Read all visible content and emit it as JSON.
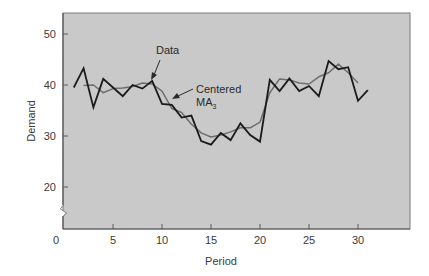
{
  "chart_data": {
    "type": "line",
    "title": "",
    "xlabel": "Period",
    "ylabel": "Demand",
    "xlim": [
      0,
      35.3
    ],
    "ylim": [
      12,
      53.5
    ],
    "axis_break_y": true,
    "grid": false,
    "legend_position": "none (inline annotations)",
    "x_ticks": [
      0,
      5,
      10,
      15,
      20,
      25,
      30
    ],
    "x_tick_labels": [
      "0",
      "5",
      "10",
      "15",
      "20",
      "25",
      "30"
    ],
    "y_ticks": [
      20,
      30,
      40,
      50
    ],
    "y_tick_labels": [
      "20",
      "30",
      "40",
      "50"
    ],
    "background_color": "#c9c9c9",
    "series": [
      {
        "name": "Data",
        "color": "#1a1a1a",
        "x": [
          1,
          2,
          3,
          4,
          5,
          6,
          7,
          8,
          9,
          10,
          11,
          12,
          13,
          14,
          15,
          16,
          17,
          18,
          19,
          20,
          21,
          22,
          23,
          24,
          25,
          26,
          27,
          28,
          29,
          30,
          31
        ],
        "values": [
          39.5,
          43.3,
          35.6,
          41.2,
          39.5,
          37.8,
          40.0,
          39.3,
          40.8,
          36.3,
          36.1,
          33.6,
          34.0,
          29.0,
          28.3,
          30.6,
          29.2,
          32.5,
          30.2,
          28.9,
          41.0,
          38.8,
          41.3,
          38.8,
          39.8,
          37.8,
          44.7,
          43.1,
          43.5,
          36.9,
          39.0
        ]
      },
      {
        "name": "Centered MA3",
        "color": "#6e6e6e",
        "x": [
          2,
          3,
          4,
          5,
          6,
          7,
          8,
          9,
          10,
          11,
          12,
          13,
          14,
          15,
          16,
          17,
          18,
          19,
          20,
          21,
          22,
          23,
          24,
          25,
          26,
          27,
          28,
          29,
          30
        ],
        "values": [
          39.9,
          40.0,
          38.5,
          39.3,
          39.4,
          39.7,
          40.4,
          40.2,
          38.8,
          35.4,
          34.6,
          32.3,
          30.6,
          29.8,
          30.2,
          30.8,
          31.6,
          31.6,
          32.7,
          38.5,
          41.2,
          41.0,
          40.4,
          40.2,
          41.6,
          42.4,
          44.1,
          42.4,
          40.4
        ]
      }
    ],
    "annotations": [
      {
        "text": "Data",
        "points_to_series": "Data",
        "at_x": 9
      },
      {
        "text": "Centered",
        "subtext": "MA",
        "subscript": "3",
        "points_to_series": "Centered MA3",
        "at_x": 11
      }
    ]
  }
}
